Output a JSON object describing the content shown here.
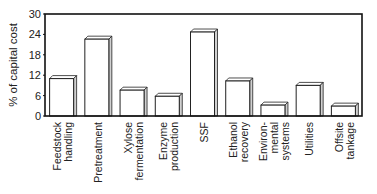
{
  "chart_data": {
    "type": "bar",
    "title": "",
    "xlabel": "",
    "ylabel": "% of capital cost",
    "ylim": [
      0,
      30
    ],
    "yticks": [
      0,
      6,
      12,
      18,
      24,
      30
    ],
    "grid": false,
    "legend": null,
    "categories": [
      [
        "Feedstock",
        "handling"
      ],
      [
        "Pretreatment"
      ],
      [
        "Xylose",
        "fermentation"
      ],
      [
        "Enzyme",
        "production"
      ],
      [
        "SSF"
      ],
      [
        "Ethanol",
        "recovery"
      ],
      [
        "Environ-",
        "mental",
        "systems"
      ],
      [
        "Utilities"
      ],
      [
        "Offsite",
        "tankage"
      ]
    ],
    "category_names": [
      "Feedstock handling",
      "Pretreatment",
      "Xylose fermentation",
      "Enzyme production",
      "SSF",
      "Ethanol recovery",
      "Environmental systems",
      "Utilities",
      "Offsite tankage"
    ],
    "values": [
      11,
      22.6,
      7.6,
      5.8,
      24.7,
      10.3,
      3.2,
      9,
      2.9
    ]
  },
  "colors": {
    "bar_fill": "#ffffff",
    "bar_stroke": "#222222",
    "bar_side": "#d0d0d0",
    "axis": "#111111"
  }
}
